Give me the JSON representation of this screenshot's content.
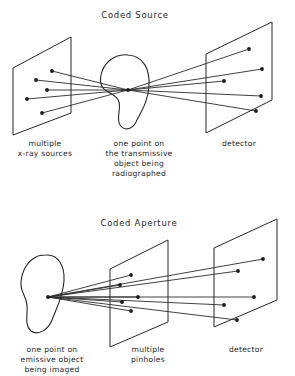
{
  "figure": {
    "background_color": "#ffffff",
    "ink_color": "#262626",
    "panels": [
      {
        "id": "coded-source",
        "title": "Coded Source",
        "title_pos": {
          "x": 135,
          "y": 18
        },
        "captions": [
          {
            "name": "caption-multiple-xray-sources",
            "lines": [
              "multiple",
              "x-ray sources"
            ],
            "x": 45,
            "y": 146,
            "line_height": 10
          },
          {
            "name": "caption-transmissive-object",
            "lines": [
              "one point on",
              "the transmissive",
              "object being",
              "radiographed"
            ],
            "x": 139,
            "y": 146,
            "line_height": 10
          },
          {
            "name": "caption-detector",
            "lines": [
              "detector"
            ],
            "x": 239,
            "y": 146,
            "line_height": 10
          }
        ],
        "planes": [
          {
            "name": "plane-xray-source-array",
            "points": "13,68 71,37 71,113 13,135"
          },
          {
            "name": "plane-detector",
            "points": "206,54 272,22 272,100 206,133"
          }
        ],
        "blob": {
          "name": "transmissive-object-blob",
          "path": "M128,55 C144,56 150,70 149,86 C148,103 140,113 136,122 C132,130 124,131 120,125 C116,119 121,110 119,102 C117,94 108,94 103,88 C98,81 101,68 109,61 C115,56 121,54 128,55 Z"
        },
        "focus_point": {
          "x": 128,
          "y": 90,
          "name": "object-focus-point"
        },
        "source_dots": [
          {
            "x": 52,
            "y": 71
          },
          {
            "x": 36,
            "y": 80
          },
          {
            "x": 47,
            "y": 90
          },
          {
            "x": 27,
            "y": 99
          },
          {
            "x": 42,
            "y": 113
          }
        ],
        "detector_dots": [
          {
            "x": 249,
            "y": 49
          },
          {
            "x": 262,
            "y": 69
          },
          {
            "x": 224,
            "y": 81
          },
          {
            "x": 261,
            "y": 96
          },
          {
            "x": 256,
            "y": 111
          }
        ],
        "ray_pairs": [
          {
            "from": 0,
            "to": 4
          },
          {
            "from": 1,
            "to": 3
          },
          {
            "from": 2,
            "to": 2
          },
          {
            "from": 3,
            "to": 1
          },
          {
            "from": 4,
            "to": 0
          }
        ]
      },
      {
        "id": "coded-aperture",
        "title": "Coded Aperture",
        "title_pos": {
          "x": 139,
          "y": 226
        },
        "captions": [
          {
            "name": "caption-emissive-object",
            "lines": [
              "one point on",
              "emissive object",
              "being imaged"
            ],
            "x": 52,
            "y": 352,
            "line_height": 10
          },
          {
            "name": "caption-multiple-pinholes",
            "lines": [
              "multiple",
              "pinholes"
            ],
            "x": 148,
            "y": 352,
            "line_height": 10
          },
          {
            "name": "caption-detector-2",
            "lines": [
              "detector"
            ],
            "x": 246,
            "y": 352,
            "line_height": 10
          }
        ],
        "planes": [
          {
            "name": "plane-pinhole-array",
            "points": "110,269 168,240 168,322 110,347"
          },
          {
            "name": "plane-detector-2",
            "points": "214,248 277,219 277,300 214,327"
          }
        ],
        "blob": {
          "name": "emissive-object-blob",
          "path": "M46,255 C58,254 65,266 64,281 C63,297 56,309 52,320 C48,330 38,336 31,331 C24,325 28,314 27,305 C26,295 20,292 21,282 C22,270 28,261 36,257 C39,255 43,255 46,255 Z"
        },
        "focus_point": {
          "x": 48,
          "y": 297,
          "name": "emission-point"
        },
        "pinhole_dots": [
          {
            "x": 131,
            "y": 275
          },
          {
            "x": 120,
            "y": 285
          },
          {
            "x": 138,
            "y": 297
          },
          {
            "x": 122,
            "y": 302
          },
          {
            "x": 131,
            "y": 311
          }
        ],
        "detector_dots": [
          {
            "x": 263,
            "y": 259
          },
          {
            "x": 238,
            "y": 271
          },
          {
            "x": 254,
            "y": 297
          },
          {
            "x": 224,
            "y": 305
          },
          {
            "x": 237,
            "y": 320
          }
        ],
        "ray_pairs": [
          {
            "from": 0,
            "to": 0
          },
          {
            "from": 1,
            "to": 1
          },
          {
            "from": 2,
            "to": 2
          },
          {
            "from": 3,
            "to": 3
          },
          {
            "from": 4,
            "to": 4
          }
        ]
      }
    ]
  }
}
